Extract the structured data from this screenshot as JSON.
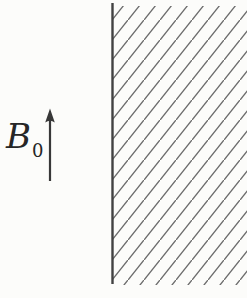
{
  "figure": {
    "type": "physics-field-boundary-diagram",
    "background_color": "#fcfcfa",
    "field_label": {
      "base": "B",
      "subscript": "0",
      "color": "#262626"
    },
    "field_arrow": {
      "direction": "up",
      "color": "#383838"
    },
    "boundary_line": {
      "orientation": "vertical",
      "color": "#424242",
      "thickness_px": 2.4
    },
    "hatched_region": {
      "side": "right-of-boundary",
      "hatch_direction": "bottom-left-to-top-right",
      "line_color": "#6b6b6b",
      "angle_deg": 51,
      "perpendicular_spacing_px": 12.5
    }
  }
}
